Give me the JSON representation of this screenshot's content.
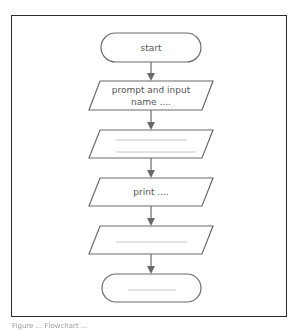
{
  "diagram": {
    "type": "flowchart",
    "nodes": [
      {
        "id": "start",
        "shape": "terminator",
        "lines": [
          "start"
        ]
      },
      {
        "id": "input",
        "shape": "parallelogram",
        "lines": [
          "prompt and input",
          "name ...."
        ]
      },
      {
        "id": "process_blank",
        "shape": "parallelogram",
        "lines": [],
        "blank_lines": 2
      },
      {
        "id": "print",
        "shape": "parallelogram",
        "lines": [
          "print ...."
        ]
      },
      {
        "id": "output_blank",
        "shape": "parallelogram",
        "lines": [],
        "blank_lines": 1
      },
      {
        "id": "end",
        "shape": "terminator",
        "lines": [],
        "blank_lines": 1
      }
    ],
    "edges": [
      {
        "from": "start",
        "to": "input"
      },
      {
        "from": "input",
        "to": "process_blank"
      },
      {
        "from": "process_blank",
        "to": "print"
      },
      {
        "from": "print",
        "to": "output_blank"
      },
      {
        "from": "output_blank",
        "to": "end"
      }
    ],
    "colors": {
      "stroke": "#6a6a6a",
      "frame": "#2a2a2a",
      "text": "#555555"
    }
  },
  "caption": "Figure ... Flowchart ..."
}
